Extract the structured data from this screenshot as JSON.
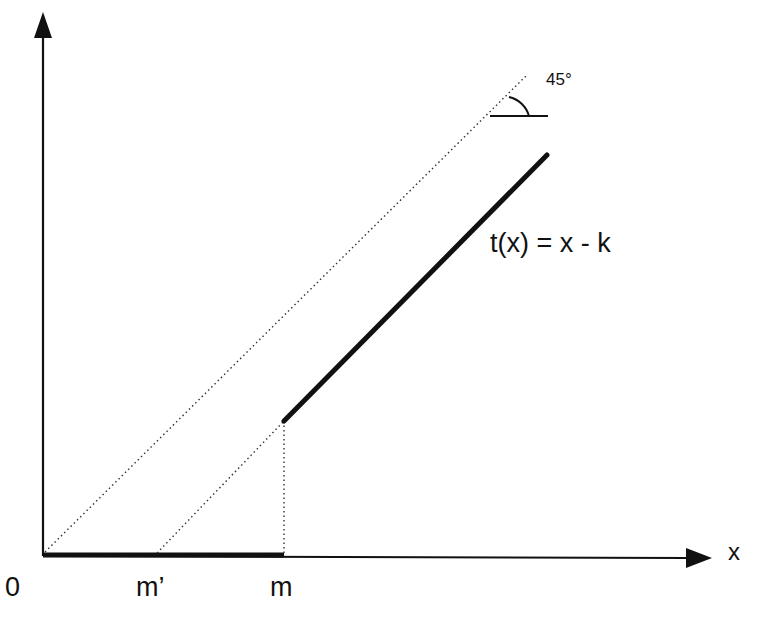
{
  "diagram": {
    "axes": {
      "origin_label": "0",
      "x_label": "x"
    },
    "ticks": {
      "m_prime": "m’",
      "m": "m"
    },
    "function_label": "t(x) = x - k",
    "angle_label": "45°",
    "colors": {
      "ink": "#111111",
      "background": "#ffffff"
    }
  }
}
